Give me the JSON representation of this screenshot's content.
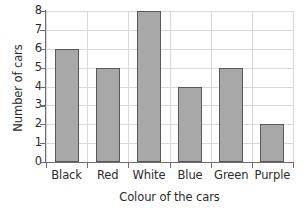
{
  "chart_data": {
    "type": "bar",
    "title": "",
    "categories": [
      "Black",
      "Red",
      "White",
      "Blue",
      "Green",
      "Purple"
    ],
    "values": [
      6,
      5,
      8,
      4,
      5,
      2
    ],
    "xlabel": "Colour of the cars",
    "ylabel": "Number of cars",
    "ylim": [
      0,
      8
    ],
    "yticks": [
      0,
      1,
      2,
      3,
      4,
      5,
      6,
      7,
      8
    ],
    "ytick_labels": [
      "0",
      "1",
      "2",
      "3",
      "4",
      "5",
      "6",
      "7",
      "8"
    ],
    "grid": true,
    "grid_axes": "both",
    "legend": false,
    "bar_fill_color": "#a8a8a8",
    "bar_edge_color": "#585858",
    "gridline_color": "#d9d9d9",
    "axis_color": "#6e6e6e",
    "text_color": "#2b2b2b",
    "background_color": "#ffffff"
  }
}
